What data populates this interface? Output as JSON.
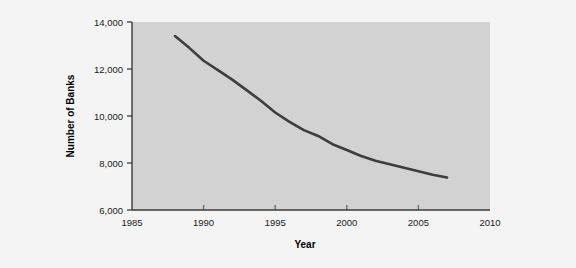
{
  "figure": {
    "background_color": "#f4f4f4",
    "plot_background_color": "#d2d2d2",
    "axis_color": "#3a3a3a",
    "line_color": "#3d3d3d"
  },
  "axes": {
    "x_title": "Year",
    "y_title": "Number of Banks",
    "x_ticks": [
      "1985",
      "1990",
      "1995",
      "2000",
      "2005",
      "2010"
    ],
    "y_ticks": [
      "14,000",
      "12,000",
      "10,000",
      "8,000",
      "6,000"
    ]
  },
  "chart_data": {
    "type": "line",
    "title": "",
    "xlabel": "Year",
    "ylabel": "Number of Banks",
    "xlim": [
      1985,
      2010
    ],
    "ylim": [
      6000,
      14000
    ],
    "xticks": [
      1985,
      1990,
      1995,
      2000,
      2005,
      2010
    ],
    "yticks": [
      6000,
      8000,
      10000,
      12000,
      14000
    ],
    "grid": false,
    "legend": false,
    "series": [
      {
        "name": "Number of Banks",
        "x": [
          1988,
          1989,
          1990,
          1991,
          1992,
          1993,
          1994,
          1995,
          1996,
          1997,
          1998,
          1999,
          2000,
          2001,
          2002,
          2003,
          2004,
          2005,
          2006,
          2007
        ],
        "values": [
          13400,
          12900,
          12350,
          11950,
          11550,
          11100,
          10650,
          10150,
          9750,
          9400,
          9150,
          8800,
          8550,
          8300,
          8100,
          7950,
          7800,
          7650,
          7500,
          7380
        ]
      }
    ]
  }
}
